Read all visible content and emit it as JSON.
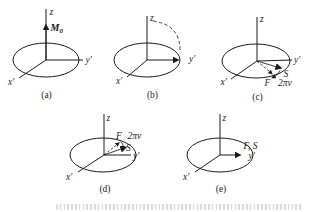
{
  "figure": {
    "background_color": "#ffffff",
    "line_color": "#1c1c1c",
    "faint_caption_color": "#b9b9b9",
    "subfigures": {
      "a": {
        "caption": "(a)",
        "z_label": "z",
        "y_label": "y′",
        "x_label": "x′",
        "vector_m_main": "M",
        "vector_m_sub": "0"
      },
      "b": {
        "caption": "(b)",
        "z_label": "z",
        "y_label": "y′",
        "x_label": "x′"
      },
      "c": {
        "caption": "(c)",
        "z_label": "z",
        "y_label": "y′",
        "x_label": "x′",
        "s_label": "S",
        "f_label": "F",
        "freq_label": "2πν"
      },
      "d": {
        "caption": "(d)",
        "z_label": "z",
        "y_label": "y′",
        "x_label": "x′",
        "s_label": "S",
        "f_label": "F",
        "freq_label": "2πν"
      },
      "e": {
        "caption": "(e)",
        "z_label": "z",
        "y_label": "y′",
        "x_label": "x′",
        "fs_label": "F, S"
      }
    }
  }
}
